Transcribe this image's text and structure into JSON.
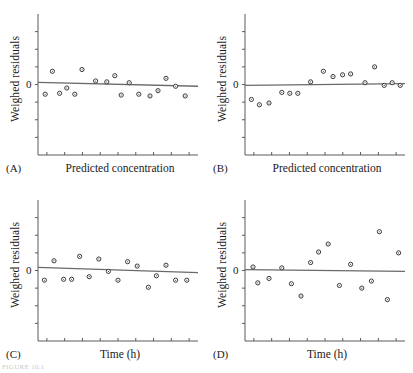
{
  "figure": {
    "background": "#ffffff",
    "axis_color": "#5a5a5a",
    "marker_edge_color": "#3a3a3a",
    "marker_fill_color": "#ffffff",
    "line_color": "#6a6a6a",
    "caption_fragment": "FIGURE 10.1"
  },
  "panels": [
    {
      "letter": "(A)",
      "xlabel": "Predicted concentration",
      "ylabel": "Weighed residuals",
      "zero_tick_label": "0"
    },
    {
      "letter": "(B)",
      "xlabel": "Predicted concentration",
      "ylabel": "Weighed residuals",
      "zero_tick_label": "0"
    },
    {
      "letter": "(C)",
      "xlabel": "Time (h)",
      "ylabel": "Weighed residuals",
      "zero_tick_label": "0"
    },
    {
      "letter": "(D)",
      "xlabel": "Time (h)",
      "ylabel": "Weighed residuals",
      "zero_tick_label": "0"
    }
  ],
  "chart_data": [
    {
      "type": "scatter",
      "panel": "A",
      "title": "",
      "xlabel": "Predicted concentration",
      "ylabel": "Weighed residuals",
      "xlim": [
        0,
        10
      ],
      "ylim": [
        -4,
        4
      ],
      "ytick_values": [
        -3,
        -2,
        -1,
        0,
        1,
        2,
        3
      ],
      "ytick_labels": [
        "",
        "",
        "",
        "0",
        "",
        "",
        ""
      ],
      "xtick_count": 9,
      "grid": false,
      "legend": false,
      "trend_line": {
        "y_start": 0.12,
        "y_end": -0.1
      },
      "x": [
        0.45,
        0.9,
        1.35,
        1.8,
        2.3,
        2.75,
        3.6,
        4.3,
        4.8,
        5.2,
        5.7,
        6.3,
        7.0,
        7.5,
        8.0,
        8.6,
        9.2
      ],
      "y": [
        -0.55,
        0.75,
        -0.5,
        -0.2,
        -0.55,
        0.85,
        0.2,
        0.15,
        0.5,
        -0.6,
        0.1,
        -0.55,
        -0.65,
        -0.35,
        0.35,
        -0.1,
        -0.65
      ]
    },
    {
      "type": "scatter",
      "panel": "B",
      "title": "",
      "xlabel": "Predicted concentration",
      "ylabel": "Weighed residuals",
      "xlim": [
        0,
        10
      ],
      "ylim": [
        -4,
        4
      ],
      "ytick_values": [
        -3,
        -2,
        -1,
        0,
        1,
        2,
        3
      ],
      "ytick_labels": [
        "",
        "",
        "",
        "0",
        "",
        "",
        ""
      ],
      "xtick_count": 9,
      "grid": false,
      "legend": false,
      "trend_line": {
        "y_start": -0.05,
        "y_end": 0.05
      },
      "x": [
        0.4,
        0.9,
        1.5,
        2.3,
        2.8,
        3.3,
        4.1,
        4.9,
        5.5,
        6.1,
        6.6,
        7.5,
        8.1,
        8.7,
        9.2,
        9.7
      ],
      "y": [
        -0.85,
        -1.15,
        -1.05,
        -0.45,
        -0.5,
        -0.5,
        0.15,
        0.75,
        0.45,
        0.55,
        0.6,
        0.1,
        1.0,
        -0.05,
        0.1,
        -0.05
      ]
    },
    {
      "type": "scatter",
      "panel": "C",
      "title": "",
      "xlabel": "Time (h)",
      "ylabel": "Weighed residuals",
      "xlim": [
        0,
        10
      ],
      "ylim": [
        -4,
        4
      ],
      "ytick_values": [
        -3,
        -2,
        -1,
        0,
        1,
        2,
        3
      ],
      "ytick_labels": [
        "",
        "",
        "",
        "0",
        "",
        "",
        ""
      ],
      "xtick_count": 9,
      "grid": false,
      "legend": false,
      "trend_line": {
        "y_start": 0.18,
        "y_end": -0.12
      },
      "x": [
        0.4,
        1.0,
        1.6,
        2.1,
        2.6,
        3.2,
        3.8,
        4.4,
        5.0,
        5.6,
        6.2,
        6.9,
        7.4,
        8.0,
        8.6,
        9.3
      ],
      "y": [
        -0.55,
        0.55,
        -0.5,
        -0.5,
        0.8,
        -0.35,
        0.65,
        -0.05,
        -0.55,
        0.5,
        0.25,
        -0.95,
        -0.3,
        0.3,
        -0.55,
        -0.55
      ]
    },
    {
      "type": "scatter",
      "panel": "D",
      "title": "",
      "xlabel": "Time (h)",
      "ylabel": "Weighed residuals",
      "xlim": [
        0,
        10
      ],
      "ylim": [
        -4,
        4
      ],
      "ytick_values": [
        -3,
        -2,
        -1,
        0,
        1,
        2,
        3
      ],
      "ytick_labels": [
        "",
        "",
        "",
        "0",
        "",
        "",
        ""
      ],
      "xtick_count": 9,
      "grid": false,
      "legend": false,
      "trend_line": {
        "y_start": 0.05,
        "y_end": -0.05
      },
      "x": [
        0.5,
        0.8,
        1.5,
        2.3,
        2.9,
        3.5,
        4.1,
        4.6,
        5.2,
        5.9,
        6.6,
        7.3,
        7.9,
        8.4,
        8.9,
        9.6
      ],
      "y": [
        0.2,
        -0.7,
        -0.45,
        0.15,
        -0.75,
        -1.45,
        0.45,
        1.05,
        1.5,
        -0.85,
        0.35,
        -1.0,
        -0.6,
        2.2,
        -1.65,
        1.0
      ]
    }
  ]
}
